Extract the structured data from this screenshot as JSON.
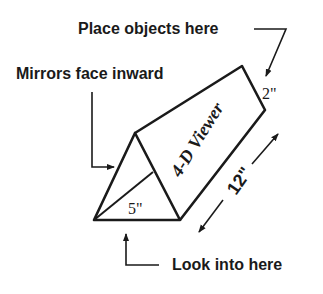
{
  "diagram": {
    "labels": {
      "place_objects": "Place objects here",
      "mirrors": "Mirrors face inward",
      "look_into": "Look into here"
    },
    "viewer_title": "4-D Viewer",
    "dimensions": {
      "height": "2\"",
      "base": "5\"",
      "length": "12\""
    },
    "colors": {
      "line": "#1a1a1a",
      "background": "#ffffff"
    }
  }
}
